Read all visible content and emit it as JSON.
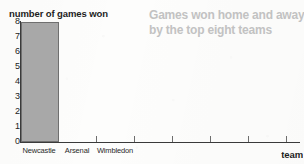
{
  "chart_data": {
    "type": "bar",
    "title": "Games won home and away by the top eight teams",
    "title_lines": [
      "Games won home and away",
      "by the top eight teams"
    ],
    "ylabel": "number of games won",
    "xlabel": "team",
    "categories": [
      "Newcastle",
      "Arsenal",
      "Wimbledon"
    ],
    "values": [
      8,
      0,
      0
    ],
    "series": [
      {
        "name": "games won",
        "values": [
          8,
          0,
          0
        ]
      }
    ],
    "ylim": [
      0,
      8
    ],
    "ytick_labels": [
      "8",
      "7",
      "6",
      "5",
      "4",
      "3",
      "2",
      "1",
      "0"
    ],
    "ytick_values": [
      8,
      7,
      6,
      5,
      4,
      3,
      2,
      1,
      0
    ],
    "grid": false,
    "legend": "none",
    "bar_color": "#a8a8a8",
    "bar_border_color": "#6f6f6f",
    "axis_color": "#3a3a3a",
    "title_color": "#c2c2c2",
    "text_color": "#1d1d1d"
  }
}
